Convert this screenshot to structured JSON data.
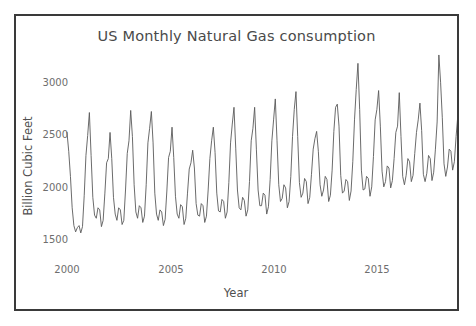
{
  "top_strip": {
    "cropped_text": " "
  },
  "figure": {
    "title": "US Monthly Natural Gas consumption",
    "line_color": "#5a5a5a",
    "frame_color": "#3a3a3a",
    "background_color": "#ffffff",
    "tick_label_color": "#6e6e6e"
  },
  "axes": {
    "xlabel": "Year",
    "ylabel": "Billion Cubic Feet",
    "x_ticks": [
      "2000",
      "2005",
      "2010",
      "2015"
    ],
    "y_ticks": [
      "1500",
      "2000",
      "2500",
      "3000"
    ]
  },
  "chart_data": {
    "type": "line",
    "title": "US Monthly Natural Gas consumption",
    "xlabel": "Year",
    "ylabel": "Billion Cubic Feet",
    "xlim": [
      2000.0,
      2018.6
    ],
    "ylim": [
      1380,
      3260
    ],
    "x_ticks": [
      2000,
      2005,
      2010,
      2015
    ],
    "y_ticks": [
      1500,
      2000,
      2500,
      3000
    ],
    "grid": false,
    "legend": "none",
    "x_unit": "year (monthly samples)",
    "series": [
      {
        "name": "US Monthly Natural Gas consumption",
        "color": "#5a5a5a",
        "x_start": 2000.0,
        "x_step": 0.08333,
        "values": [
          2480,
          2300,
          2060,
          1760,
          1590,
          1530,
          1570,
          1590,
          1520,
          1580,
          1880,
          2260,
          2450,
          2670,
          2260,
          1860,
          1690,
          1660,
          1760,
          1740,
          1580,
          1640,
          1900,
          2190,
          2230,
          2480,
          2230,
          1860,
          1700,
          1640,
          1760,
          1740,
          1600,
          1640,
          1930,
          2280,
          2400,
          2690,
          2440,
          1980,
          1720,
          1660,
          1780,
          1760,
          1620,
          1680,
          1980,
          2380,
          2520,
          2680,
          2380,
          1900,
          1700,
          1640,
          1740,
          1720,
          1590,
          1650,
          1920,
          2240,
          2300,
          2530,
          2240,
          1870,
          1700,
          1660,
          1790,
          1770,
          1600,
          1660,
          1900,
          2130,
          2190,
          2310,
          2140,
          1800,
          1690,
          1680,
          1800,
          1780,
          1620,
          1680,
          1930,
          2230,
          2400,
          2530,
          2290,
          1900,
          1730,
          1720,
          1840,
          1820,
          1660,
          1720,
          2000,
          2380,
          2560,
          2720,
          2330,
          1930,
          1760,
          1740,
          1860,
          1830,
          1680,
          1740,
          2010,
          2400,
          2520,
          2720,
          2320,
          1930,
          1780,
          1780,
          1900,
          1880,
          1700,
          1770,
          2030,
          2400,
          2600,
          2800,
          2400,
          1980,
          1820,
          1850,
          1980,
          1950,
          1760,
          1820,
          2060,
          2440,
          2700,
          2870,
          2440,
          2000,
          1860,
          1900,
          2040,
          2010,
          1800,
          1860,
          2080,
          2320,
          2420,
          2490,
          2300,
          1980,
          1870,
          1930,
          2060,
          2030,
          1820,
          1880,
          2120,
          2490,
          2720,
          2750,
          2540,
          2070,
          1900,
          1920,
          2030,
          2010,
          1830,
          1920,
          2200,
          2600,
          2890,
          3140,
          2700,
          2120,
          1930,
          1940,
          2060,
          2040,
          1870,
          1960,
          2250,
          2600,
          2700,
          2880,
          2540,
          2110,
          1960,
          2010,
          2160,
          2140,
          1950,
          2020,
          2230,
          2480,
          2540,
          2860,
          2440,
          2060,
          1980,
          2070,
          2230,
          2200,
          2010,
          2070,
          2280,
          2480,
          2600,
          2760,
          2500,
          2080,
          2010,
          2090,
          2260,
          2230,
          2020,
          2100,
          2320,
          2580,
          3220,
          2960,
          2620,
          2180,
          2060,
          2150,
          2320,
          2300,
          2120,
          2200,
          2440,
          2640
        ]
      }
    ]
  }
}
